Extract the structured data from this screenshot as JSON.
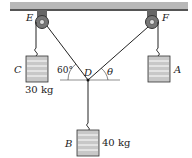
{
  "diagram": {
    "ceiling": {
      "color": "#9a9a9a"
    },
    "pulleys": [
      {
        "label": "E",
        "cx": 42,
        "cy": 23
      },
      {
        "label": "F",
        "cx": 152,
        "cy": 23
      }
    ],
    "knot": {
      "label": "D",
      "x": 88,
      "y": 80
    },
    "masses": [
      {
        "id": "C",
        "label": "C",
        "mass_label": "30 kg"
      },
      {
        "id": "A",
        "label": "A",
        "mass_label": ""
      },
      {
        "id": "B",
        "label": "B",
        "mass_label": "40 kg"
      }
    ],
    "angles": [
      {
        "label": "60°",
        "at": "D-left"
      },
      {
        "label": "θ",
        "at": "D-right"
      }
    ],
    "colors": {
      "line": "#222222",
      "weight_fill": "#bdbdbd",
      "weight_stripe": "#ffffff",
      "pulley": "#555555"
    }
  }
}
